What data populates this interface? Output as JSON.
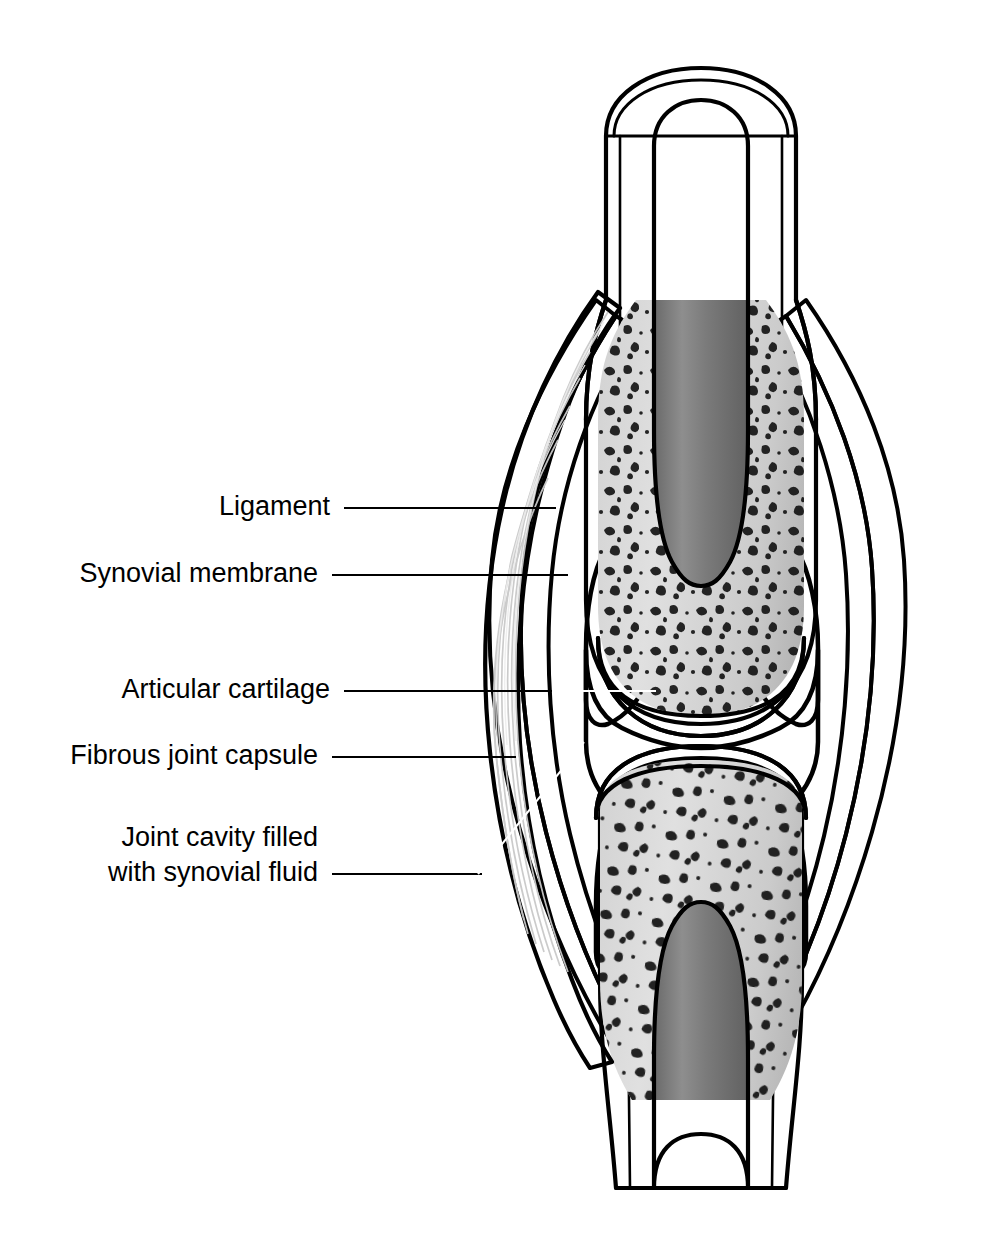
{
  "figure": {
    "width": 986,
    "height": 1252,
    "background": "#ffffff"
  },
  "labels": [
    {
      "id": "ligament",
      "text": "Ligament",
      "text_x": 330,
      "text_y": 508,
      "leader": "M 344 508 L 556 508",
      "leader_color": "#000000",
      "target": "ligament-band"
    },
    {
      "id": "synovial-membrane",
      "text": "Synovial membrane",
      "text_x": 318,
      "text_y": 575,
      "leader": "M 332 575 L 568 575",
      "leader_color": "#000000",
      "target": "synovial-membrane-layer"
    },
    {
      "id": "articular-cartilage",
      "text": "Articular cartilage",
      "text_x": 330,
      "text_y": 691,
      "leader": "M 344 691 L 655 691",
      "leader_color": "#000000",
      "target": "upper-articular-cartilage"
    },
    {
      "id": "fibrous-joint-capsule",
      "text": "Fibrous joint capsule",
      "text_x": 318,
      "text_y": 757,
      "leader": "M 332 757 L 516 757",
      "leader_color": "#000000",
      "target": "fibrous-capsule-layer"
    },
    {
      "id": "joint-cavity",
      "text_lines": [
        "Joint cavity filled",
        "with synovial fluid"
      ],
      "text_x": 318,
      "text_y_1": 839,
      "text_y_2": 874,
      "leader": "M 332 874 L 480 874 L 582 744",
      "leader_color": "#000000",
      "target": "joint-cavity-space"
    }
  ],
  "anatomy": {
    "parts": [
      {
        "name": "upper-bone-shaft",
        "label": "Upper long bone (diaphysis)"
      },
      {
        "name": "upper-epiphysis",
        "label": "Upper epiphysis — spongy bone"
      },
      {
        "name": "upper-medullary-cavity",
        "label": "Upper medullary cavity"
      },
      {
        "name": "upper-articular-cartilage",
        "label": "Articular cartilage (upper)"
      },
      {
        "name": "lower-bone-shaft",
        "label": "Lower long bone (diaphysis)"
      },
      {
        "name": "lower-epiphysis",
        "label": "Lower epiphysis — spongy bone"
      },
      {
        "name": "lower-medullary-cavity",
        "label": "Lower medullary cavity"
      },
      {
        "name": "lower-articular-cartilage",
        "label": "Articular cartilage (lower)"
      },
      {
        "name": "joint-cavity-space",
        "label": "Joint cavity with synovial fluid"
      },
      {
        "name": "synovial-membrane-layer",
        "label": "Synovial membrane"
      },
      {
        "name": "fibrous-capsule-layer",
        "label": "Fibrous joint capsule"
      },
      {
        "name": "ligament-band",
        "label": "Ligament"
      }
    ]
  },
  "colors": {
    "outline": "#000000",
    "bone_cortical": "#bfbfbf",
    "bone_cortical_light": "#d4d4d4",
    "spongy_bone": "#d2d2d2",
    "spongy_marks": "#101010",
    "medullary_cavity": "#808080",
    "medullary_cavity_dark": "#6e6e6e",
    "joint_cavity": "#2b2b2b",
    "joint_cavity_mid": "#3a3a3a",
    "capsule": "#c0c0c0",
    "synovial_membrane": "#d8d8d8",
    "ligament": "#fafafa",
    "ligament_shade": "#e2e2e2",
    "background": "#ffffff"
  }
}
